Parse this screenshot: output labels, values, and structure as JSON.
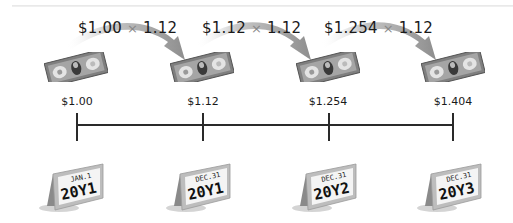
{
  "diagram": {
    "rate_multiplier": "1.12",
    "formulas": [
      {
        "base": "$1.00",
        "operator": "×",
        "multiplier": "1.12"
      },
      {
        "base": "$1.12",
        "operator": "×",
        "multiplier": "1.12"
      },
      {
        "base": "$1.254",
        "operator": "×",
        "multiplier": "1.12"
      }
    ],
    "values": [
      "$1.00",
      "$1.12",
      "$1.254",
      "$1.404"
    ],
    "dates": [
      {
        "month_day": "JAN.1",
        "year": "20Y1"
      },
      {
        "month_day": "DEC.31",
        "year": "20Y1"
      },
      {
        "month_day": "DEC.31",
        "year": "20Y2"
      },
      {
        "month_day": "DEC.31",
        "year": "20Y3"
      }
    ],
    "icons": {
      "bill": "dollar-bill-icon",
      "calendar": "desk-calendar-icon",
      "arrow": "curved-arrow-icon"
    },
    "colors": {
      "arrow": "#9a9a9a",
      "line": "#2a2a2a",
      "bill_body": "#8a8a8a",
      "bill_panel": "#d8d8d8"
    }
  }
}
